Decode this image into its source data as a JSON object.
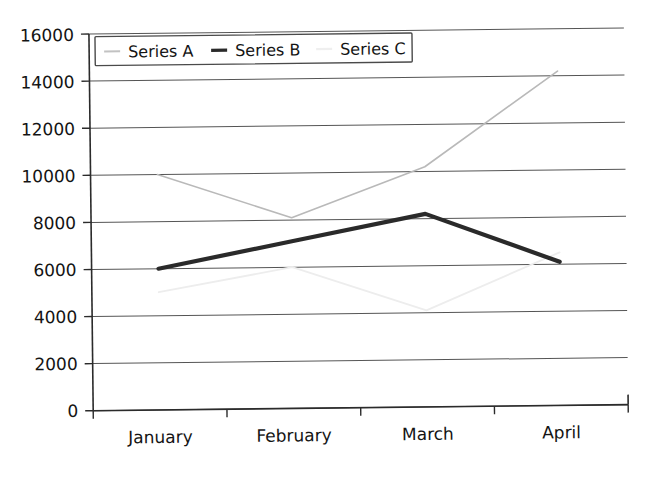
{
  "chart_data": {
    "type": "line",
    "title": "",
    "subtitle": "",
    "xlabel": "",
    "ylabel": "",
    "categories": [
      "January",
      "February",
      "March",
      "April"
    ],
    "series": [
      {
        "name": "Series A",
        "values": [
          10000,
          8100,
          10200,
          14200
        ],
        "color": "#b9b9b9",
        "width": 1.6
      },
      {
        "name": "Series B",
        "values": [
          6000,
          7100,
          8200,
          6100
        ],
        "color": "#2a2a2a",
        "width": 4.2
      },
      {
        "name": "Series C",
        "values": [
          5000,
          6000,
          4100,
          6500
        ],
        "color": "#ededed",
        "width": 1.8
      }
    ],
    "ylim": [
      0,
      16000
    ],
    "ytick_values": [
      0,
      2000,
      4000,
      6000,
      8000,
      10000,
      12000,
      14000,
      16000
    ],
    "ytick_labels": [
      "0",
      "2000",
      "4000",
      "6000",
      "8000",
      "10000",
      "12000",
      "14000",
      "16000"
    ],
    "xtick_labels": [
      "January",
      "February",
      "March",
      "April"
    ],
    "grid": true,
    "grid_axis": "y",
    "legend": {
      "position": "top-left-inside",
      "entries": [
        {
          "label": "Series A",
          "marker": "line-dash",
          "color": "#b9b9b9"
        },
        {
          "label": "Series B",
          "marker": "line-dash",
          "color": "#2a2a2a"
        },
        {
          "label": "Series C",
          "marker": "line-dash",
          "color": "#ededed"
        }
      ]
    },
    "annotations": []
  }
}
